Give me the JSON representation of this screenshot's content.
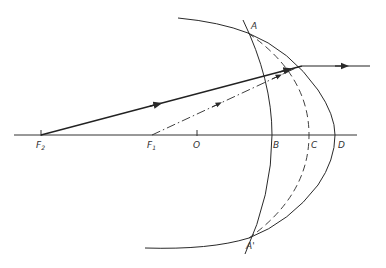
{
  "diagram": {
    "type": "optics ray diagram",
    "colors": {
      "line": "#2a2a2a",
      "background": "#ffffff"
    },
    "points": {
      "F2": {
        "label": "F",
        "sub": "2"
      },
      "F1": {
        "label": "F",
        "sub": "1"
      },
      "O": {
        "label": "O"
      },
      "A": {
        "label": "A"
      },
      "A_prime": {
        "label": "A'"
      },
      "B": {
        "label": "B"
      },
      "C": {
        "label": "C"
      },
      "D": {
        "label": "D"
      }
    },
    "elements": [
      "optical-axis",
      "arc-through-B",
      "dashed-arc-through-C",
      "arc-through-D",
      "large-arc-through-A-and-A-prime",
      "solid-ray-from-F2",
      "dash-dot-ray-from-F1",
      "outgoing-horizontal-ray"
    ]
  }
}
